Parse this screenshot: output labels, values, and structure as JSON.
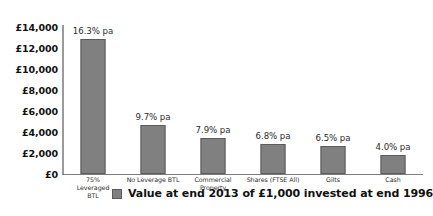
{
  "chart_data": {
    "type": "bar",
    "title": "",
    "subtitle": "",
    "xlabel": "",
    "ylabel": "",
    "ylim": [
      0,
      14000
    ],
    "ytick_labels": [
      "£14,000",
      "£12,000",
      "£10,000",
      "£8,000",
      "£6,000",
      "£4,000",
      "£2,000",
      "£0"
    ],
    "ytick_values": [
      14000,
      12000,
      10000,
      8000,
      6000,
      4000,
      2000,
      0
    ],
    "grid": false,
    "legend_position": "bottom",
    "categories": [
      "75% Leveraged BTL",
      "No Leverage BTL",
      "Commercial Property",
      "Shares (FTSE All)",
      "Gilts",
      "Cash"
    ],
    "category_lines": [
      [
        "75%",
        "Leveraged",
        "BTL"
      ],
      [
        "No Leverage BTL"
      ],
      [
        "Commercial Property"
      ],
      [
        "Shares (FTSE All)"
      ],
      [
        "Gilts"
      ],
      [
        "Cash"
      ]
    ],
    "values": [
      12850,
      4600,
      3350,
      2850,
      2650,
      1750
    ],
    "data_labels": [
      "16.3% pa",
      "9.7% pa",
      "7.9% pa",
      "6.8% pa",
      "6.5% pa",
      "4.0% pa"
    ],
    "series": [
      {
        "name": "Value at end 2013 of £1,000 invested at end 1996",
        "values": [
          12850,
          4600,
          3350,
          2850,
          2650,
          1750
        ],
        "color": "#808080"
      }
    ],
    "legend": [
      {
        "label": "Value at end 2013 of £1,000 invested at end 1996",
        "color": "#808080"
      }
    ]
  },
  "colors": {
    "bar_fill": "#808080",
    "bar_stroke": "#5c5c5c",
    "axis": "#7d7d7d",
    "text": "#111111",
    "background": "#ffffff"
  }
}
